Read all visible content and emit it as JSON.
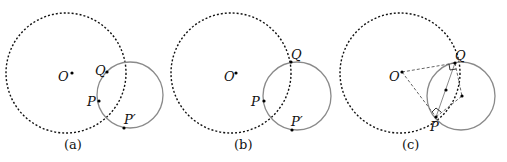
{
  "figure": {
    "panels": [
      {
        "caption": "(a)",
        "labels": {
          "O": "O",
          "Q": "Q",
          "P": "P",
          "Pp": "P′"
        }
      },
      {
        "caption": "(b)",
        "labels": {
          "O": "O",
          "Q": "Q",
          "P": "P",
          "Pp": "P′"
        }
      },
      {
        "caption": "(c)",
        "labels": {
          "O": "O",
          "Q": "Q",
          "P": "P"
        }
      }
    ],
    "colors": {
      "dashed_circle": "#111111",
      "solid_circle": "#8a8a8a",
      "construction_lines": "#666666",
      "points": "#000000"
    }
  }
}
